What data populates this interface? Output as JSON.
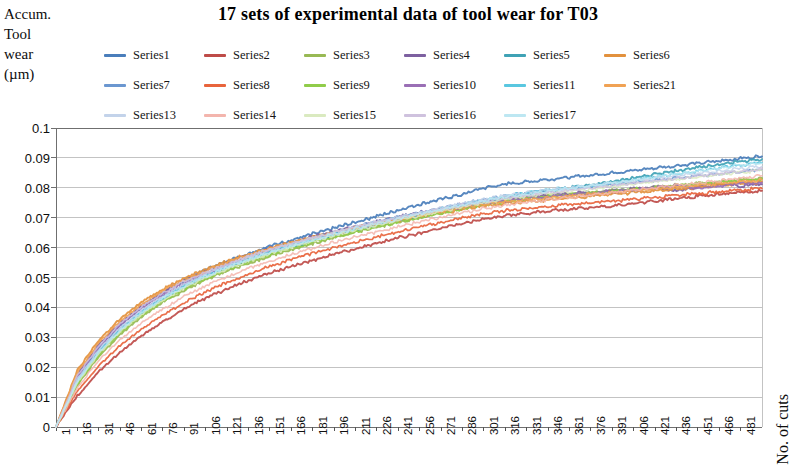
{
  "chart_title": "17 sets of experimental data of tool wear for T03",
  "y_axis_title_lines": [
    "Accum.",
    "Tool",
    "wear",
    "(µm)"
  ],
  "x_axis_title": "No. of cuts",
  "legend": {
    "rows": [
      [
        {
          "label": "Series1",
          "color": "#4a7ebb"
        },
        {
          "label": "Series2",
          "color": "#be4b48"
        },
        {
          "label": "Series3",
          "color": "#98b954"
        },
        {
          "label": "Series4",
          "color": "#7d60a0"
        },
        {
          "label": "Series5",
          "color": "#3fa2b5"
        },
        {
          "label": "Series6",
          "color": "#e2913d"
        }
      ],
      [
        {
          "label": "Series7",
          "color": "#6b97d0"
        },
        {
          "label": "Series8",
          "color": "#e8643c"
        },
        {
          "label": "Series9",
          "color": "#90cc4a"
        },
        {
          "label": "Series10",
          "color": "#9a6fb5"
        },
        {
          "label": "Series11",
          "color": "#59c7e0"
        },
        {
          "label": "Series21",
          "color": "#f0a254"
        }
      ],
      [
        {
          "label": "Series13",
          "color": "#c3d3ea"
        },
        {
          "label": "Series14",
          "color": "#f3b5ad"
        },
        {
          "label": "Series15",
          "color": "#daeac0"
        },
        {
          "label": "Series16",
          "color": "#cfc2de"
        },
        {
          "label": "Series17",
          "color": "#bde7f2"
        }
      ]
    ]
  },
  "chart_data": {
    "type": "line",
    "title": "17 sets of experimental data of tool wear for T03",
    "xlabel": "No. of cuts",
    "ylabel": "Accum. Tool wear (µm)",
    "xlim": [
      1,
      496
    ],
    "ylim": [
      0,
      0.1
    ],
    "grid": true,
    "legend_position": "top",
    "y_ticks": [
      0,
      0.01,
      0.02,
      0.03,
      0.04,
      0.05,
      0.06,
      0.07,
      0.08,
      0.09,
      0.1
    ],
    "y_tick_labels": [
      "0",
      "0.01",
      "0.02",
      "0.03",
      "0.04",
      "0.05",
      "0.06",
      "0.07",
      "0.08",
      "0.09",
      "0.1"
    ],
    "x_ticks": [
      1,
      16,
      31,
      46,
      61,
      76,
      91,
      106,
      121,
      136,
      151,
      166,
      181,
      196,
      211,
      226,
      241,
      256,
      271,
      286,
      301,
      316,
      331,
      346,
      361,
      376,
      391,
      406,
      421,
      436,
      451,
      466,
      481
    ],
    "x_tick_labels": [
      "1",
      "16",
      "31",
      "46",
      "61",
      "76",
      "91",
      "106",
      "121",
      "136",
      "151",
      "166",
      "181",
      "196",
      "211",
      "226",
      "241",
      "256",
      "271",
      "286",
      "301",
      "316",
      "331",
      "346",
      "361",
      "376",
      "391",
      "406",
      "421",
      "436",
      "451",
      "466",
      "481"
    ],
    "x_sample": [
      1,
      16,
      31,
      46,
      61,
      76,
      91,
      106,
      121,
      136,
      151,
      166,
      181,
      196,
      211,
      226,
      241,
      256,
      271,
      286,
      301,
      316,
      331,
      346,
      361,
      376,
      391,
      406,
      421,
      436,
      451,
      466,
      481,
      496
    ],
    "series": [
      {
        "name": "Series1",
        "color": "#4a7ebb",
        "values": [
          0.0,
          0.0165,
          0.0265,
          0.034,
          0.04,
          0.045,
          0.049,
          0.0525,
          0.0555,
          0.058,
          0.0605,
          0.0625,
          0.0645,
          0.0665,
          0.0685,
          0.0705,
          0.0725,
          0.0745,
          0.0762,
          0.0778,
          0.08,
          0.0812,
          0.082,
          0.0828,
          0.0835,
          0.0842,
          0.085,
          0.0858,
          0.0866,
          0.0874,
          0.0882,
          0.089,
          0.0898,
          0.0905
        ]
      },
      {
        "name": "Series2",
        "color": "#be4b48",
        "values": [
          0.0,
          0.0105,
          0.0185,
          0.025,
          0.0305,
          0.0352,
          0.0395,
          0.043,
          0.0462,
          0.049,
          0.0515,
          0.0538,
          0.0558,
          0.0578,
          0.0596,
          0.0614,
          0.0632,
          0.0648,
          0.0664,
          0.068,
          0.0695,
          0.0706,
          0.0715,
          0.0722,
          0.0728,
          0.0734,
          0.074,
          0.0748,
          0.0756,
          0.0764,
          0.0772,
          0.0778,
          0.0784,
          0.079
        ]
      },
      {
        "name": "Series3",
        "color": "#98b954",
        "values": [
          0.0,
          0.014,
          0.0235,
          0.031,
          0.0368,
          0.0418,
          0.0458,
          0.0492,
          0.0522,
          0.0548,
          0.0572,
          0.0594,
          0.0614,
          0.0633,
          0.0651,
          0.0668,
          0.0685,
          0.07,
          0.0715,
          0.073,
          0.0745,
          0.0756,
          0.0765,
          0.0772,
          0.0778,
          0.0784,
          0.079,
          0.0796,
          0.0802,
          0.0808,
          0.0814,
          0.082,
          0.0826,
          0.0832
        ]
      },
      {
        "name": "Series4",
        "color": "#7d60a0",
        "values": [
          0.0,
          0.0175,
          0.0275,
          0.0348,
          0.0405,
          0.0452,
          0.049,
          0.0522,
          0.055,
          0.0575,
          0.0597,
          0.0617,
          0.0636,
          0.0654,
          0.0671,
          0.0687,
          0.0702,
          0.0716,
          0.073,
          0.0743,
          0.0755,
          0.0763,
          0.077,
          0.0776,
          0.0781,
          0.0786,
          0.0791,
          0.0796,
          0.0802,
          0.079,
          0.08,
          0.0812,
          0.0806,
          0.0812
        ]
      },
      {
        "name": "Series5",
        "color": "#3fa2b5",
        "values": [
          0.0,
          0.015,
          0.0248,
          0.0322,
          0.038,
          0.0428,
          0.0468,
          0.0502,
          0.0532,
          0.0558,
          0.0582,
          0.0603,
          0.0623,
          0.0642,
          0.066,
          0.0677,
          0.0693,
          0.0708,
          0.0723,
          0.0738,
          0.0752,
          0.0768,
          0.078,
          0.079,
          0.08,
          0.081,
          0.082,
          0.0832,
          0.0844,
          0.0856,
          0.0868,
          0.0878,
          0.0888,
          0.0896
        ]
      },
      {
        "name": "Series6",
        "color": "#e2913d",
        "values": [
          0.0,
          0.019,
          0.029,
          0.0362,
          0.0418,
          0.0462,
          0.0498,
          0.0528,
          0.0554,
          0.0577,
          0.0598,
          0.0617,
          0.0634,
          0.065,
          0.0665,
          0.0679,
          0.0692,
          0.0704,
          0.0716,
          0.0728,
          0.074,
          0.0748,
          0.0754,
          0.076,
          0.0766,
          0.0772,
          0.0778,
          0.0784,
          0.079,
          0.0796,
          0.0802,
          0.0808,
          0.0814,
          0.082
        ]
      },
      {
        "name": "Series7",
        "color": "#6b97d0",
        "values": [
          0.0,
          0.0158,
          0.0256,
          0.033,
          0.0388,
          0.0436,
          0.0476,
          0.051,
          0.054,
          0.0566,
          0.059,
          0.0611,
          0.0631,
          0.065,
          0.0668,
          0.0685,
          0.0701,
          0.0716,
          0.0731,
          0.0746,
          0.076,
          0.0772,
          0.0782,
          0.079,
          0.0797,
          0.0804,
          0.0811,
          0.0818,
          0.0825,
          0.0832,
          0.0839,
          0.0846,
          0.0853,
          0.086
        ]
      },
      {
        "name": "Series8",
        "color": "#e8643c",
        "values": [
          0.0,
          0.012,
          0.0205,
          0.0272,
          0.0328,
          0.0375,
          0.0416,
          0.0452,
          0.0484,
          0.0512,
          0.0537,
          0.056,
          0.0581,
          0.06,
          0.0618,
          0.0636,
          0.0653,
          0.0669,
          0.0684,
          0.0699,
          0.0713,
          0.0723,
          0.0731,
          0.0738,
          0.0744,
          0.075,
          0.0756,
          0.0762,
          0.0768,
          0.0774,
          0.078,
          0.0786,
          0.0792,
          0.0798
        ]
      },
      {
        "name": "Series9",
        "color": "#90cc4a",
        "values": [
          0.0,
          0.0145,
          0.0242,
          0.0316,
          0.0374,
          0.0422,
          0.0462,
          0.0496,
          0.0526,
          0.0552,
          0.0576,
          0.0597,
          0.0617,
          0.0636,
          0.0653,
          0.067,
          0.0686,
          0.0701,
          0.0716,
          0.073,
          0.0744,
          0.0755,
          0.0764,
          0.0771,
          0.0777,
          0.0783,
          0.0789,
          0.0795,
          0.0801,
          0.0807,
          0.0813,
          0.0819,
          0.0825,
          0.083
        ]
      },
      {
        "name": "Series10",
        "color": "#9a6fb5",
        "values": [
          0.0,
          0.0168,
          0.0268,
          0.0342,
          0.0398,
          0.0444,
          0.0482,
          0.0514,
          0.0542,
          0.0567,
          0.059,
          0.061,
          0.0629,
          0.0647,
          0.0664,
          0.068,
          0.0695,
          0.0709,
          0.0723,
          0.0736,
          0.0748,
          0.0757,
          0.0764,
          0.077,
          0.0776,
          0.0781,
          0.0787,
          0.0793,
          0.08,
          0.0808,
          0.0796,
          0.0805,
          0.0814,
          0.0818
        ]
      },
      {
        "name": "Series11",
        "color": "#59c7e0",
        "values": [
          0.0,
          0.0155,
          0.0252,
          0.0326,
          0.0384,
          0.0432,
          0.0472,
          0.0506,
          0.0536,
          0.0562,
          0.0586,
          0.0608,
          0.0628,
          0.0647,
          0.0665,
          0.0682,
          0.0698,
          0.0714,
          0.0729,
          0.0744,
          0.0758,
          0.0772,
          0.0783,
          0.0792,
          0.08,
          0.0808,
          0.0816,
          0.0826,
          0.0836,
          0.0846,
          0.0856,
          0.0866,
          0.0876,
          0.0884
        ]
      },
      {
        "name": "Series21",
        "color": "#f0a254",
        "values": [
          0.0,
          0.0182,
          0.0282,
          0.0355,
          0.041,
          0.0455,
          0.0492,
          0.0523,
          0.055,
          0.0574,
          0.0596,
          0.0615,
          0.0633,
          0.065,
          0.0666,
          0.0681,
          0.0695,
          0.0708,
          0.0721,
          0.0733,
          0.0745,
          0.0753,
          0.076,
          0.0766,
          0.0772,
          0.0778,
          0.0784,
          0.079,
          0.0796,
          0.0802,
          0.0808,
          0.0814,
          0.082,
          0.0826
        ]
      },
      {
        "name": "Series13",
        "color": "#c3d3ea",
        "values": [
          0.0,
          0.016,
          0.0258,
          0.0332,
          0.039,
          0.0438,
          0.0477,
          0.0511,
          0.0541,
          0.0567,
          0.0591,
          0.0612,
          0.0632,
          0.0651,
          0.0669,
          0.0686,
          0.0702,
          0.0717,
          0.0732,
          0.0747,
          0.0761,
          0.0774,
          0.0784,
          0.0792,
          0.08,
          0.0808,
          0.0816,
          0.0824,
          0.0832,
          0.084,
          0.0848,
          0.0856,
          0.0864,
          0.0872
        ]
      },
      {
        "name": "Series14",
        "color": "#f3b5ad",
        "values": [
          0.0,
          0.0132,
          0.0222,
          0.0292,
          0.0348,
          0.0396,
          0.0437,
          0.0472,
          0.0503,
          0.053,
          0.0555,
          0.0578,
          0.0598,
          0.0618,
          0.0636,
          0.0653,
          0.067,
          0.0686,
          0.0701,
          0.0716,
          0.073,
          0.0742,
          0.0752,
          0.076,
          0.0768,
          0.0776,
          0.0784,
          0.0792,
          0.08,
          0.0808,
          0.0816,
          0.0824,
          0.0832,
          0.084
        ]
      },
      {
        "name": "Series15",
        "color": "#daeac0",
        "values": [
          0.0,
          0.0148,
          0.0245,
          0.0319,
          0.0377,
          0.0425,
          0.0465,
          0.0499,
          0.0529,
          0.0555,
          0.0579,
          0.0601,
          0.0621,
          0.064,
          0.0658,
          0.0675,
          0.0691,
          0.0706,
          0.0721,
          0.0736,
          0.075,
          0.0762,
          0.0772,
          0.078,
          0.0788,
          0.0796,
          0.0804,
          0.0812,
          0.082,
          0.0828,
          0.0836,
          0.0844,
          0.0852,
          0.0858
        ]
      },
      {
        "name": "Series16",
        "color": "#cfc2de",
        "values": [
          0.0,
          0.0172,
          0.0271,
          0.0345,
          0.0402,
          0.0448,
          0.0486,
          0.0518,
          0.0546,
          0.0571,
          0.0594,
          0.0614,
          0.0633,
          0.0651,
          0.0668,
          0.0684,
          0.0699,
          0.0714,
          0.0728,
          0.0742,
          0.0755,
          0.0766,
          0.0775,
          0.0783,
          0.0791,
          0.0799,
          0.0807,
          0.0815,
          0.0823,
          0.0831,
          0.0839,
          0.0847,
          0.0855,
          0.0862
        ]
      },
      {
        "name": "Series17",
        "color": "#bde7f2",
        "values": [
          0.0,
          0.0152,
          0.025,
          0.0324,
          0.0382,
          0.043,
          0.047,
          0.0504,
          0.0534,
          0.056,
          0.0584,
          0.0606,
          0.0626,
          0.0645,
          0.0663,
          0.068,
          0.0696,
          0.0712,
          0.0727,
          0.0742,
          0.0756,
          0.0769,
          0.078,
          0.0789,
          0.0798,
          0.0807,
          0.0816,
          0.0826,
          0.0836,
          0.0846,
          0.0856,
          0.0866,
          0.0876,
          0.0882
        ]
      }
    ]
  },
  "plot_geometry": {
    "left": 56,
    "right": 762,
    "top": 128,
    "bottom": 427,
    "axis_color": "#6f6f6f",
    "grid_color": "#a9a9a9"
  }
}
